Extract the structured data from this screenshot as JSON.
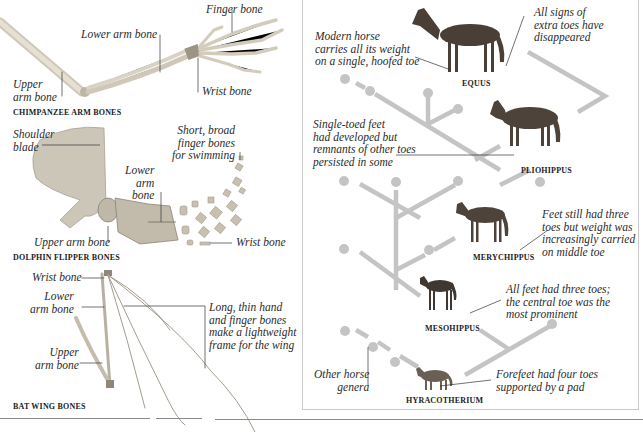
{
  "left_panel": {
    "chimpanzee": {
      "caption": "CHIMPANZEE ARM BONES",
      "labels": {
        "finger_bone": "Finger bone",
        "lower_arm_bone": "Lower arm bone",
        "upper_arm_bone": "Upper\narm bone",
        "wrist_bone": "Wrist bone"
      }
    },
    "dolphin": {
      "caption": "DOLPHIN FLIPPER BONES",
      "labels": {
        "shoulder_blade": "Shoulder\nblade",
        "finger_bones": "Short, broad\nfinger bones\nfor swimming",
        "lower_arm_bone": "Lower\narm\nbone",
        "upper_arm_bone": "Upper arm bone",
        "wrist_bone": "Wrist bone"
      }
    },
    "bat": {
      "caption": "BAT WING BONES",
      "labels": {
        "wrist_bone": "Wrist bone",
        "lower_arm_bone": "Lower\narm bone",
        "upper_arm_bone": "Upper\narm bone",
        "hand_finger_bones": "Long, thin hand\nand finger bones\nmake a lightweight\nframe for the wing"
      }
    }
  },
  "right_panel": {
    "species": [
      {
        "name": "EQUUS",
        "note": "Modern horse\ncarries all its weight\non a single, hoofed toe",
        "note2": "All signs of\nextra toes have\ndisappeared"
      },
      {
        "name": "PLIOHIPPUS",
        "note": "Single-toed feet\nhad developed but\nremnants of other toes\npersisted in some"
      },
      {
        "name": "MERYCHIPPUS",
        "note": "Feet still had three\ntoes but weight was\nincreasingly carried\non middle toe"
      },
      {
        "name": "MESOHIPPUS",
        "note": "All feet had three toes;\nthe central toe was the\nmost prominent"
      },
      {
        "name": "HYRACOTHERIUM",
        "note": "Forefeet had four toes\nsupported by a pad"
      }
    ],
    "other_genera": "Other horse\ngenera"
  },
  "colors": {
    "tree_line": "#c4c4c4",
    "bone": "#d8d2c4",
    "bone_shadow": "#a9a294",
    "horse_dark": "#4a3f36",
    "panel_border": "#c9c9c9"
  }
}
